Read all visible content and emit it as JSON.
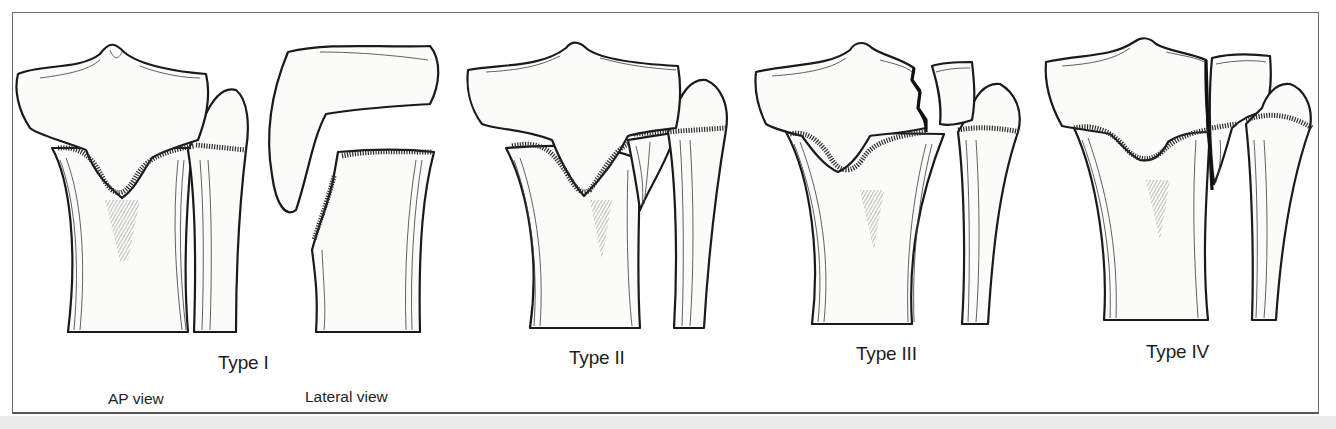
{
  "figure": {
    "panels": [
      {
        "id": "type-1",
        "label": "Type I",
        "subviews": [
          "AP view",
          "Lateral view"
        ]
      },
      {
        "id": "type-2",
        "label": "Type II"
      },
      {
        "id": "type-3",
        "label": "Type III"
      },
      {
        "id": "type-4",
        "label": "Type IV"
      }
    ],
    "view_labels": {
      "ap": "AP view",
      "lateral": "Lateral view"
    }
  },
  "colors": {
    "line": "#1a1a1a",
    "paper": "#ffffff",
    "frame": "#6a6a6a",
    "strip": "#ececec"
  }
}
